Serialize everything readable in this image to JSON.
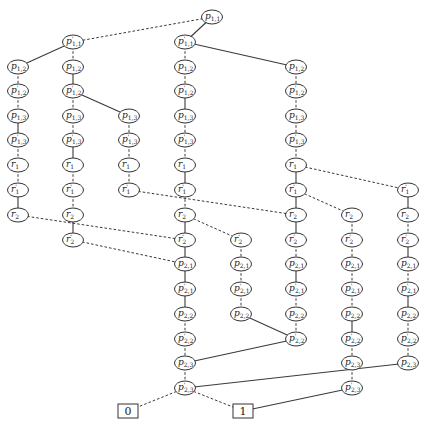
{
  "diagram": {
    "type": "binary-decision-diagram",
    "edge_styles": {
      "solid": "high/1-branch",
      "dashed": "low/0-branch"
    },
    "nodes": [
      {
        "id": "a0",
        "label": "p1,1",
        "x": 212,
        "y": 17
      },
      {
        "id": "a1",
        "label": "p'1,1",
        "x": 73,
        "y": 42
      },
      {
        "id": "a2",
        "label": "p'1,1",
        "x": 185,
        "y": 42
      },
      {
        "id": "b0",
        "label": "p1,2",
        "x": 18,
        "y": 67
      },
      {
        "id": "b1",
        "label": "p1,2",
        "x": 73,
        "y": 67
      },
      {
        "id": "b2",
        "label": "p1,2",
        "x": 185,
        "y": 67
      },
      {
        "id": "b3",
        "label": "p1,2",
        "x": 296,
        "y": 67
      },
      {
        "id": "c0",
        "label": "p'1,2",
        "x": 18,
        "y": 91
      },
      {
        "id": "c1",
        "label": "p'1,2",
        "x": 73,
        "y": 91
      },
      {
        "id": "c2",
        "label": "p'1,2",
        "x": 185,
        "y": 91
      },
      {
        "id": "c3",
        "label": "p'1,2",
        "x": 296,
        "y": 91
      },
      {
        "id": "d0",
        "label": "p1,3",
        "x": 18,
        "y": 116
      },
      {
        "id": "d1",
        "label": "p1,3",
        "x": 73,
        "y": 116
      },
      {
        "id": "d2",
        "label": "p1,3",
        "x": 129,
        "y": 116
      },
      {
        "id": "d3",
        "label": "p1,3",
        "x": 185,
        "y": 116
      },
      {
        "id": "d4",
        "label": "p1,3",
        "x": 296,
        "y": 116
      },
      {
        "id": "e0",
        "label": "p'1,3",
        "x": 18,
        "y": 140
      },
      {
        "id": "e1",
        "label": "p'1,3",
        "x": 73,
        "y": 140
      },
      {
        "id": "e2",
        "label": "p'1,3",
        "x": 129,
        "y": 140
      },
      {
        "id": "e3",
        "label": "p'1,3",
        "x": 185,
        "y": 140
      },
      {
        "id": "e4",
        "label": "p'1,3",
        "x": 296,
        "y": 140
      },
      {
        "id": "f0",
        "label": "r1",
        "x": 18,
        "y": 165
      },
      {
        "id": "f1",
        "label": "r1",
        "x": 73,
        "y": 165
      },
      {
        "id": "f2",
        "label": "r1",
        "x": 129,
        "y": 165
      },
      {
        "id": "f3",
        "label": "r1",
        "x": 185,
        "y": 165
      },
      {
        "id": "f4",
        "label": "r1",
        "x": 296,
        "y": 165
      },
      {
        "id": "g0",
        "label": "r'1",
        "x": 18,
        "y": 190
      },
      {
        "id": "g1",
        "label": "r'1",
        "x": 73,
        "y": 190
      },
      {
        "id": "g2",
        "label": "r'1",
        "x": 129,
        "y": 190
      },
      {
        "id": "g3",
        "label": "r'1",
        "x": 185,
        "y": 190
      },
      {
        "id": "g4",
        "label": "r'1",
        "x": 296,
        "y": 190
      },
      {
        "id": "g5",
        "label": "r'1",
        "x": 408,
        "y": 190
      },
      {
        "id": "h0",
        "label": "r2",
        "x": 18,
        "y": 215
      },
      {
        "id": "h1",
        "label": "r2",
        "x": 73,
        "y": 215
      },
      {
        "id": "h2",
        "label": "r2",
        "x": 185,
        "y": 215
      },
      {
        "id": "h3",
        "label": "r2",
        "x": 296,
        "y": 215
      },
      {
        "id": "h4",
        "label": "r2",
        "x": 352,
        "y": 215
      },
      {
        "id": "h5",
        "label": "r2",
        "x": 408,
        "y": 215
      },
      {
        "id": "i0",
        "label": "r'2",
        "x": 73,
        "y": 240
      },
      {
        "id": "i1",
        "label": "r'2",
        "x": 185,
        "y": 240
      },
      {
        "id": "i2",
        "label": "r'2",
        "x": 241,
        "y": 240
      },
      {
        "id": "i3",
        "label": "r'2",
        "x": 296,
        "y": 240
      },
      {
        "id": "i4",
        "label": "r'2",
        "x": 352,
        "y": 240
      },
      {
        "id": "i5",
        "label": "r'2",
        "x": 408,
        "y": 240
      },
      {
        "id": "j0",
        "label": "p2,1",
        "x": 185,
        "y": 264
      },
      {
        "id": "j1",
        "label": "p2,1",
        "x": 241,
        "y": 264
      },
      {
        "id": "j2",
        "label": "p2,1",
        "x": 296,
        "y": 264
      },
      {
        "id": "j3",
        "label": "p2,1",
        "x": 352,
        "y": 264
      },
      {
        "id": "j4",
        "label": "p2,1",
        "x": 408,
        "y": 264
      },
      {
        "id": "k0",
        "label": "p'2,1",
        "x": 185,
        "y": 289
      },
      {
        "id": "k1",
        "label": "p'2,1",
        "x": 241,
        "y": 289
      },
      {
        "id": "k2",
        "label": "p'2,1",
        "x": 296,
        "y": 289
      },
      {
        "id": "k3",
        "label": "p'2,1",
        "x": 352,
        "y": 289
      },
      {
        "id": "k4",
        "label": "p'2,1",
        "x": 408,
        "y": 289
      },
      {
        "id": "l0",
        "label": "p2,2",
        "x": 185,
        "y": 314
      },
      {
        "id": "l1",
        "label": "p2,2",
        "x": 241,
        "y": 314
      },
      {
        "id": "l2",
        "label": "p2,2",
        "x": 296,
        "y": 314
      },
      {
        "id": "l3",
        "label": "p2,2",
        "x": 352,
        "y": 314
      },
      {
        "id": "l4",
        "label": "p2,2",
        "x": 408,
        "y": 314
      },
      {
        "id": "m0",
        "label": "p'2,2",
        "x": 185,
        "y": 339
      },
      {
        "id": "m1",
        "label": "p'2,2",
        "x": 296,
        "y": 339
      },
      {
        "id": "m2",
        "label": "p'2,2",
        "x": 352,
        "y": 339
      },
      {
        "id": "m3",
        "label": "p'2,2",
        "x": 408,
        "y": 339
      },
      {
        "id": "n0",
        "label": "p2,3",
        "x": 185,
        "y": 363
      },
      {
        "id": "n1",
        "label": "p2,3",
        "x": 352,
        "y": 363
      },
      {
        "id": "n2",
        "label": "p2,3",
        "x": 408,
        "y": 363
      },
      {
        "id": "o0",
        "label": "p'2,3",
        "x": 185,
        "y": 388
      },
      {
        "id": "o1",
        "label": "p'2,3",
        "x": 352,
        "y": 388
      }
    ],
    "terminals": [
      {
        "id": "t0",
        "label": "0",
        "x": 128,
        "y": 411
      },
      {
        "id": "t1",
        "label": "1",
        "x": 243,
        "y": 411
      }
    ],
    "edges": [
      [
        "a0",
        "a1",
        "dashed"
      ],
      [
        "a0",
        "a2",
        "solid"
      ],
      [
        "a1",
        "b0",
        "solid"
      ],
      [
        "a1",
        "b1",
        "dashed"
      ],
      [
        "a2",
        "b2",
        "dashed"
      ],
      [
        "a2",
        "b3",
        "solid"
      ],
      [
        "b0",
        "c0",
        "dashed"
      ],
      [
        "b1",
        "c1",
        "solid"
      ],
      [
        "b2",
        "c2",
        "dashed"
      ],
      [
        "b3",
        "c3",
        "dashed"
      ],
      [
        "c0",
        "d0",
        "dashed"
      ],
      [
        "c1",
        "d1",
        "dashed"
      ],
      [
        "c1",
        "d2",
        "solid"
      ],
      [
        "c2",
        "d3",
        "solid"
      ],
      [
        "c3",
        "d4",
        "dashed"
      ],
      [
        "d0",
        "e0",
        "solid"
      ],
      [
        "d1",
        "e1",
        "dashed"
      ],
      [
        "d2",
        "e2",
        "dashed"
      ],
      [
        "d3",
        "e3",
        "dashed"
      ],
      [
        "d4",
        "e4",
        "dashed"
      ],
      [
        "e0",
        "f0",
        "dashed"
      ],
      [
        "e1",
        "f1",
        "solid"
      ],
      [
        "e2",
        "f2",
        "dashed"
      ],
      [
        "e3",
        "f3",
        "dashed"
      ],
      [
        "e4",
        "f4",
        "dashed"
      ],
      [
        "f0",
        "g0",
        "dashed"
      ],
      [
        "f1",
        "g1",
        "dashed"
      ],
      [
        "f2",
        "g2",
        "dashed"
      ],
      [
        "f3",
        "g3",
        "solid"
      ],
      [
        "f4",
        "g4",
        "solid"
      ],
      [
        "f4",
        "g5",
        "dashed"
      ],
      [
        "g0",
        "h0",
        "solid"
      ],
      [
        "g1",
        "h1",
        "dashed"
      ],
      [
        "g2",
        "h3",
        "dashed"
      ],
      [
        "g3",
        "h2",
        "dashed"
      ],
      [
        "g4",
        "h3",
        "solid"
      ],
      [
        "g4",
        "h4",
        "dashed"
      ],
      [
        "g5",
        "h5",
        "solid"
      ],
      [
        "h0",
        "i1",
        "dashed"
      ],
      [
        "h1",
        "i0",
        "solid"
      ],
      [
        "h2",
        "i1",
        "solid"
      ],
      [
        "h2",
        "i2",
        "dashed"
      ],
      [
        "h3",
        "i3",
        "solid"
      ],
      [
        "h4",
        "i4",
        "dashed"
      ],
      [
        "h5",
        "i5",
        "dashed"
      ],
      [
        "i0",
        "j0",
        "dashed"
      ],
      [
        "i1",
        "j0",
        "solid"
      ],
      [
        "i2",
        "j1",
        "dashed"
      ],
      [
        "i3",
        "j2",
        "dashed"
      ],
      [
        "i4",
        "j3",
        "dashed"
      ],
      [
        "i5",
        "j4",
        "solid"
      ],
      [
        "j0",
        "k0",
        "solid"
      ],
      [
        "j1",
        "k1",
        "dashed"
      ],
      [
        "j2",
        "k2",
        "solid"
      ],
      [
        "j3",
        "k3",
        "dashed"
      ],
      [
        "j4",
        "k4",
        "dashed"
      ],
      [
        "k0",
        "l0",
        "solid"
      ],
      [
        "k1",
        "l1",
        "dashed"
      ],
      [
        "k2",
        "l2",
        "dashed"
      ],
      [
        "k3",
        "l3",
        "dashed"
      ],
      [
        "k4",
        "l4",
        "solid"
      ],
      [
        "l0",
        "m0",
        "dashed"
      ],
      [
        "l1",
        "m1",
        "solid"
      ],
      [
        "l2",
        "m1",
        "dashed"
      ],
      [
        "l3",
        "m2",
        "solid"
      ],
      [
        "l4",
        "m3",
        "dashed"
      ],
      [
        "m0",
        "n0",
        "dashed"
      ],
      [
        "m1",
        "n0",
        "solid"
      ],
      [
        "m2",
        "n1",
        "dashed"
      ],
      [
        "m3",
        "n2",
        "dashed"
      ],
      [
        "n0",
        "o0",
        "dashed"
      ],
      [
        "n1",
        "o1",
        "dashed"
      ],
      [
        "n2",
        "o0",
        "solid"
      ],
      [
        "o0",
        "t0",
        "dashed"
      ],
      [
        "o0",
        "t1",
        "dashed"
      ],
      [
        "o1",
        "t1",
        "solid"
      ]
    ]
  }
}
